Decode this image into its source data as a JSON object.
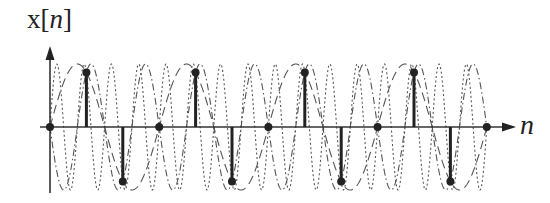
{
  "chart_data": {
    "type": "line",
    "title": "",
    "ylabel_prefix": "x[",
    "ylabel_var": "n",
    "ylabel_suffix": "]",
    "xlabel": "n",
    "x": [
      0,
      1,
      2,
      3,
      4,
      5,
      6,
      7,
      8,
      9,
      10,
      11,
      12
    ],
    "series": [
      {
        "name": "x[n] samples",
        "style": "stem",
        "values": [
          0,
          0.866,
          -0.866,
          0,
          0.866,
          -0.866,
          0,
          0.866,
          -0.866,
          0,
          0.866,
          -0.866,
          0
        ]
      },
      {
        "name": "alias f=1/3",
        "style": "dashed",
        "frequency_cycles_per_sample": 0.3333,
        "amplitude": 1
      },
      {
        "name": "alias f=-2/3",
        "style": "dash-dot",
        "frequency_cycles_per_sample": -0.6667,
        "amplitude": 1
      },
      {
        "name": "alias f=4/3",
        "style": "dotted",
        "frequency_cycles_per_sample": 1.3333,
        "amplitude": 1
      }
    ],
    "ylim": [
      -1,
      1
    ],
    "grid": false,
    "legend": "none",
    "colors": {
      "stroke": "#222222",
      "curve": "#555555",
      "background": "#ffffff"
    },
    "layout": {
      "origin_px": [
        50,
        127
      ],
      "sample_spacing_px": 36.4,
      "amplitude_px": 63,
      "x_axis_end_px": 515,
      "y_axis_top_px": 46,
      "y_axis_bottom_px": 193
    }
  }
}
